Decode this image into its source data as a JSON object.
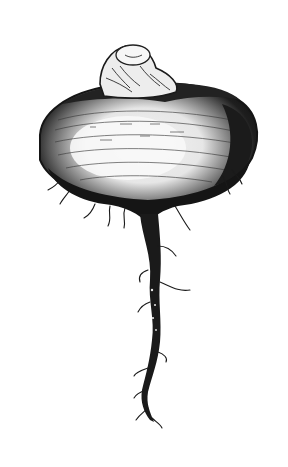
{
  "image": {
    "subject": "engraved illustration of a turnip-shaped root vegetable with a tapering taproot",
    "style": "black and white woodcut / engraving",
    "background_color": "#ffffff",
    "ink_color": "#1a1a1a",
    "highlight_color": "#f2f2f2"
  }
}
